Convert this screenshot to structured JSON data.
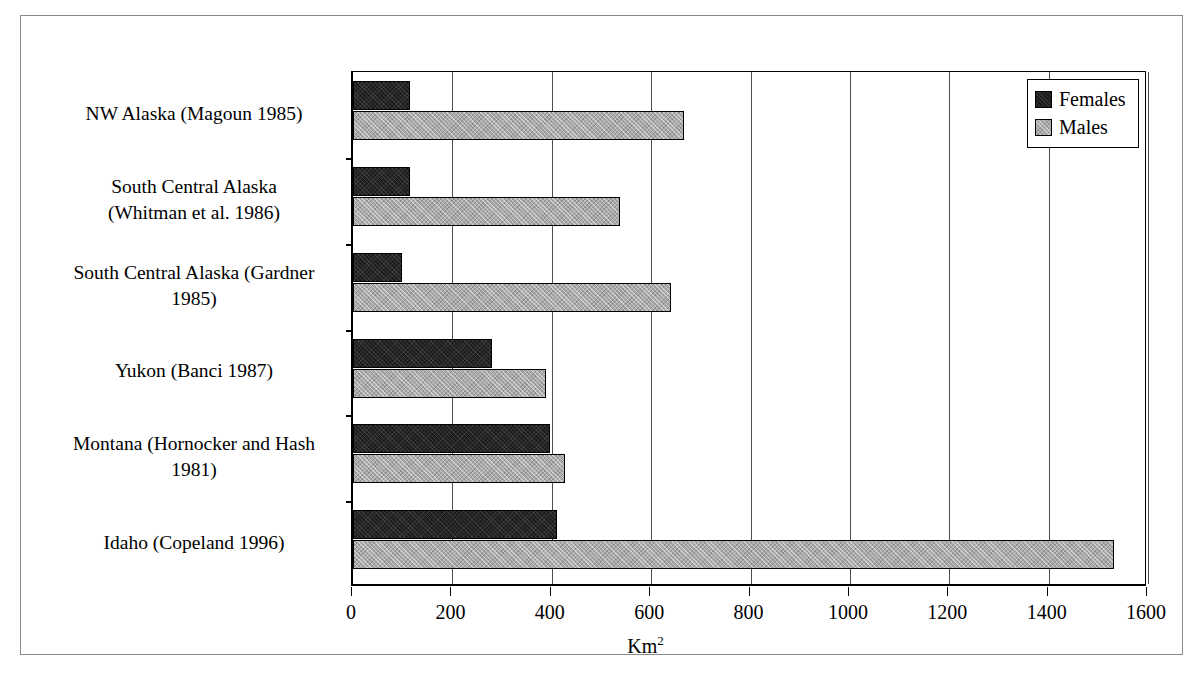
{
  "chart_data": {
    "type": "bar",
    "orientation": "horizontal",
    "title": "",
    "xlabel": "Km2",
    "xlabel_base": "Km",
    "xlabel_sup": "2",
    "ylabel": "",
    "xlim": [
      0,
      1600
    ],
    "xticks": [
      0,
      200,
      400,
      600,
      800,
      1000,
      1200,
      1400,
      1600
    ],
    "xtick_labels": [
      "0",
      "200",
      "400",
      "600",
      "800",
      "1000",
      "1200",
      "1400",
      "1600"
    ],
    "grid": "vertical",
    "legend_position": "top-right",
    "categories": [
      "NW Alaska (Magoun 1985)",
      "South Central Alaska (Whitman et al. 1986)",
      "South Central Alaska (Gardner 1985)",
      "Yukon (Banci 1987)",
      "Montana (Hornocker and Hash 1981)",
      "Idaho (Copeland 1996)"
    ],
    "category_lines": [
      [
        "NW Alaska (Magoun 1985)"
      ],
      [
        "South Central Alaska",
        "(Whitman et al. 1986)"
      ],
      [
        "South Central Alaska (Gardner",
        "1985)"
      ],
      [
        "Yukon (Banci 1987)"
      ],
      [
        "Montana (Hornocker and Hash",
        "1981)"
      ],
      [
        "Idaho (Copeland 1996)"
      ]
    ],
    "series": [
      {
        "name": "Females",
        "color": "#1c1c1c",
        "values": [
          115,
          115,
          99,
          279,
          396,
          410
        ]
      },
      {
        "name": "Males",
        "color": "#a9a9a9",
        "values": [
          667,
          537,
          640,
          388,
          426,
          1532
        ]
      }
    ]
  },
  "legend": {
    "entries": [
      {
        "label": "Females",
        "swatch": "females"
      },
      {
        "label": "Males",
        "swatch": "males"
      }
    ]
  }
}
